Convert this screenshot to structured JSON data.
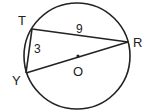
{
  "figure": {
    "circle": {
      "cx": 77,
      "cy": 56,
      "r": 53,
      "stroke": "#222222"
    },
    "center": {
      "label": "O",
      "x": 78,
      "y": 56
    },
    "points": {
      "T": {
        "label": "T",
        "x": 32,
        "y": 29
      },
      "R": {
        "label": "R",
        "x": 128,
        "y": 42
      },
      "Y": {
        "label": "Y",
        "x": 26,
        "y": 73
      }
    },
    "segments": {
      "TR": {
        "label": "9"
      },
      "TY": {
        "label": "3"
      },
      "YR": {
        "label": ""
      }
    }
  }
}
